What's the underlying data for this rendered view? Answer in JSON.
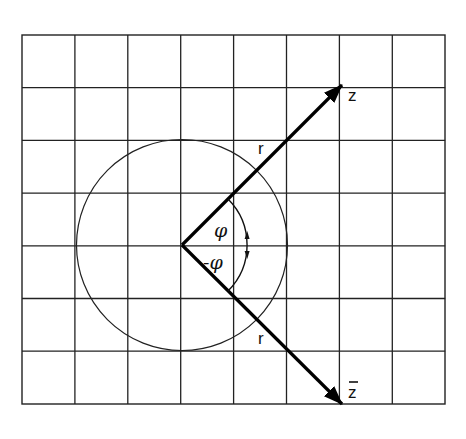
{
  "diagram": {
    "grid": {
      "left": 22,
      "top": 35,
      "columns": 8,
      "rows": 7,
      "cell_w": 52.9,
      "cell_h": 52.7
    },
    "origin": {
      "x": 182,
      "y": 245
    },
    "circle_radius_cells": 2,
    "vector_length_cells": 3,
    "angle_deg": 45,
    "labels": {
      "z": "z",
      "z_conjugate": "z",
      "r_upper": "r",
      "r_lower": "r",
      "phi": "φ",
      "minus_phi": "-φ"
    },
    "colors": {
      "ink": "#111111",
      "grid": "#222222",
      "background": "#ffffff"
    }
  }
}
